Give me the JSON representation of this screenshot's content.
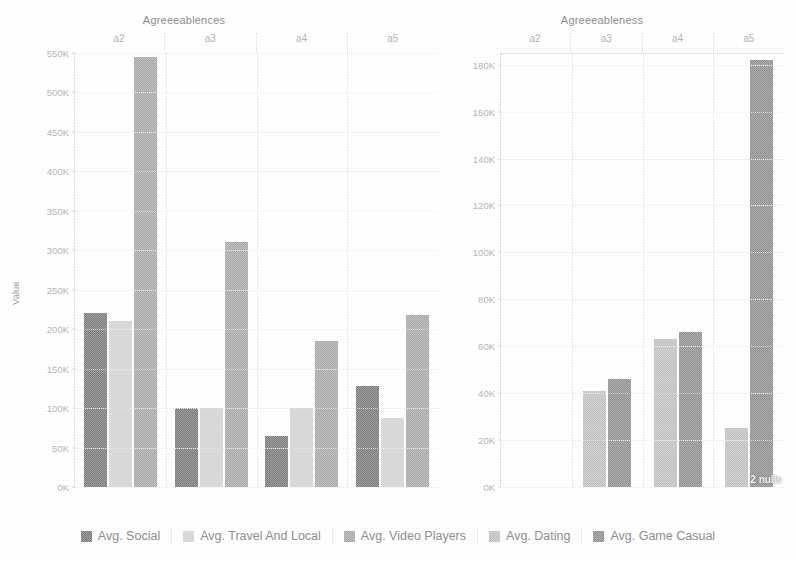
{
  "chart_data": [
    {
      "type": "bar",
      "title": "Agreeeablences",
      "xlabel": "",
      "ylabel": "Value",
      "categories": [
        "a2",
        "a3",
        "a4",
        "a5"
      ],
      "ylim": [
        0,
        550000
      ],
      "ytick_labels": [
        "0K",
        "50K",
        "100K",
        "150K",
        "200K",
        "250K",
        "300K",
        "350K",
        "400K",
        "450K",
        "500K",
        "550K"
      ],
      "ytick_values": [
        0,
        50000,
        100000,
        150000,
        200000,
        250000,
        300000,
        350000,
        400000,
        450000,
        500000,
        550000
      ],
      "grid": true,
      "legend_position": "bottom",
      "series": [
        {
          "name": "Avg. Social",
          "color": "#7a7a7a",
          "values": [
            220000,
            100000,
            65000,
            128000
          ]
        },
        {
          "name": "Avg. Travel And Local",
          "color": "#d2d2d2",
          "values": [
            210000,
            100000,
            100000,
            88000
          ]
        },
        {
          "name": "Avg. Video Players",
          "color": "#a8a8a8",
          "values": [
            545000,
            310000,
            185000,
            218000
          ]
        }
      ]
    },
    {
      "type": "bar",
      "title": "Agreeeableness",
      "xlabel": "",
      "ylabel": "",
      "categories": [
        "a2",
        "a3",
        "a4",
        "a5"
      ],
      "ylim": [
        0,
        185000
      ],
      "ytick_labels": [
        "0K",
        "20K",
        "40K",
        "60K",
        "80K",
        "100K",
        "120K",
        "140K",
        "160K",
        "180K"
      ],
      "ytick_values": [
        0,
        20000,
        40000,
        60000,
        80000,
        100000,
        120000,
        140000,
        160000,
        180000
      ],
      "grid": true,
      "legend_position": "bottom",
      "annotation": "2 nulls",
      "series": [
        {
          "name": "Avg. Dating",
          "color": "#c0c0c0",
          "values": [
            null,
            41000,
            63000,
            25000
          ]
        },
        {
          "name": "Avg. Game Casual",
          "color": "#8f8f8f",
          "values": [
            null,
            46000,
            66000,
            182000
          ]
        }
      ]
    }
  ],
  "legend": {
    "items": [
      {
        "label": "Avg. Social",
        "color": "#7a7a7a"
      },
      {
        "label": "Avg. Travel And Local",
        "color": "#d2d2d2"
      },
      {
        "label": "Avg. Video Players",
        "color": "#a8a8a8"
      },
      {
        "label": "Avg. Dating",
        "color": "#c0c0c0"
      },
      {
        "label": "Avg. Game Casual",
        "color": "#8f8f8f"
      }
    ]
  }
}
